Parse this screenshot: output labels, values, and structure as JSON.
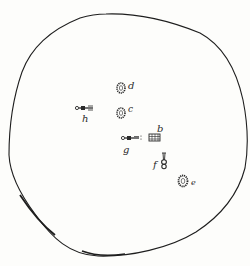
{
  "figure": {
    "outline_color": "#1e1e1e",
    "ink_color": "#2a2a2a",
    "background": "#fdfdfb"
  },
  "objects": [
    {
      "id": "a",
      "label": "d",
      "shape": "oval-ring",
      "x": 121,
      "y": 88
    },
    {
      "id": "c",
      "label": "c",
      "shape": "oval-ring",
      "x": 121,
      "y": 113
    },
    {
      "id": "b",
      "label": "b",
      "shape": "rect-grid",
      "x": 153,
      "y": 137
    },
    {
      "id": "g",
      "label": "g",
      "shape": "key",
      "x": 130,
      "y": 137
    },
    {
      "id": "h",
      "label": "h",
      "shape": "key",
      "x": 85,
      "y": 110
    },
    {
      "id": "f",
      "label": "f",
      "shape": "bottle",
      "x": 163,
      "y": 164
    },
    {
      "id": "e",
      "label": "e",
      "shape": "oval-ring",
      "x": 183,
      "y": 180
    }
  ],
  "labels": {
    "d": "d",
    "c": "c",
    "b": "b",
    "g": "g",
    "h": "h",
    "f": "f",
    "e": "e"
  }
}
